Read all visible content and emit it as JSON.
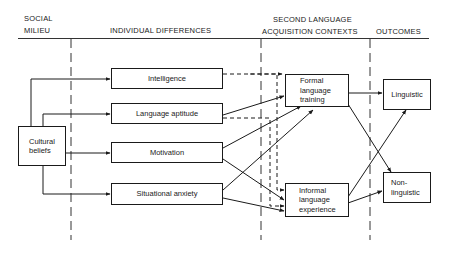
{
  "headers": {
    "social_milieu_line1": "SOCIAL",
    "social_milieu_line2": "MILIEU",
    "individual_differences": "INDIVIDUAL DIFFERENCES",
    "slac_line1": "SECOND LANGUAGE",
    "slac_line2": "ACQUISITION CONTEXTS",
    "outcomes": "OUTCOMES"
  },
  "nodes": {
    "cultural_beliefs": "Cultural\nbeliefs",
    "intelligence": "Intelligence",
    "language_aptitude": "Language aptitude",
    "motivation": "Motivation",
    "situational_anxiety": "Situational anxiety",
    "formal_training": "Formal\nlanguage\ntraining",
    "informal_experience": "Informal\nlanguage\nexperience",
    "linguistic": "Linguistic",
    "non_linguistic": "Non-\nlinguistic"
  },
  "edges": [
    {
      "from": "cultural_beliefs",
      "to": "intelligence",
      "style": "solid"
    },
    {
      "from": "cultural_beliefs",
      "to": "language_aptitude",
      "style": "solid"
    },
    {
      "from": "cultural_beliefs",
      "to": "motivation",
      "style": "solid"
    },
    {
      "from": "cultural_beliefs",
      "to": "situational_anxiety",
      "style": "solid"
    },
    {
      "from": "intelligence",
      "to": "formal_training",
      "style": "dashed"
    },
    {
      "from": "intelligence",
      "to": "informal_experience",
      "style": "dashed"
    },
    {
      "from": "language_aptitude",
      "to": "formal_training",
      "style": "solid"
    },
    {
      "from": "language_aptitude",
      "to": "informal_experience",
      "style": "dashed"
    },
    {
      "from": "motivation",
      "to": "formal_training",
      "style": "solid"
    },
    {
      "from": "motivation",
      "to": "informal_experience",
      "style": "solid"
    },
    {
      "from": "situational_anxiety",
      "to": "formal_training",
      "style": "solid"
    },
    {
      "from": "situational_anxiety",
      "to": "informal_experience",
      "style": "solid"
    },
    {
      "from": "formal_training",
      "to": "linguistic",
      "style": "solid"
    },
    {
      "from": "formal_training",
      "to": "non_linguistic",
      "style": "solid"
    },
    {
      "from": "informal_experience",
      "to": "linguistic",
      "style": "solid"
    },
    {
      "from": "informal_experience",
      "to": "non_linguistic",
      "style": "solid"
    }
  ]
}
